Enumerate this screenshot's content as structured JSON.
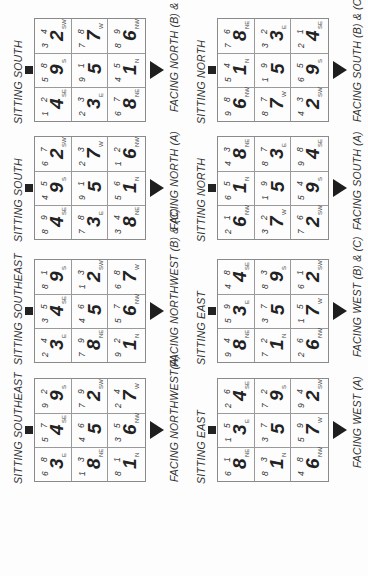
{
  "charts": [
    {
      "sitting": "SITTING SOUTHEAST",
      "facing": "FACING NORTHWEST(A)",
      "cells": [
        {
          "m": "6",
          "w": "8",
          "p": "3",
          "d": "E"
        },
        {
          "m": "5",
          "w": "7",
          "p": "4",
          "d": "SE"
        },
        {
          "m": "9",
          "w": "2",
          "p": "9",
          "d": "S"
        },
        {
          "m": "1",
          "w": "3",
          "p": "8",
          "d": "NE"
        },
        {
          "m": "4",
          "w": "6",
          "p": "5",
          "d": ""
        },
        {
          "m": "7",
          "w": "9",
          "p": "2",
          "d": "SW"
        },
        {
          "m": "8",
          "w": "1",
          "p": "1",
          "d": "N"
        },
        {
          "m": "3",
          "w": "5",
          "p": "6",
          "d": "NW"
        },
        {
          "m": "2",
          "w": "4",
          "p": "7",
          "d": "W"
        }
      ]
    },
    {
      "sitting": "SITTING SOUTHEAST",
      "facing": "FACING NORTHWEST (B) & (C)",
      "cells": [
        {
          "m": "2",
          "w": "4",
          "p": "3",
          "d": "E"
        },
        {
          "m": "3",
          "w": "5",
          "p": "4",
          "d": "SE"
        },
        {
          "m": "8",
          "w": "1",
          "p": "9",
          "d": "S"
        },
        {
          "m": "7",
          "w": "9",
          "p": "8",
          "d": "NE"
        },
        {
          "m": "4",
          "w": "6",
          "p": "5",
          "d": ""
        },
        {
          "m": "1",
          "w": "3",
          "p": "2",
          "d": "SW"
        },
        {
          "m": "9",
          "w": "2",
          "p": "1",
          "d": "N"
        },
        {
          "m": "5",
          "w": "7",
          "p": "6",
          "d": "NW"
        },
        {
          "m": "6",
          "w": "8",
          "p": "7",
          "d": "W"
        }
      ]
    },
    {
      "sitting": "SITTING SOUTH",
      "facing": "FACING NORTH (A)",
      "cells": [
        {
          "m": "8",
          "w": "9",
          "p": "4",
          "d": "SE"
        },
        {
          "m": "4",
          "w": "5",
          "p": "9",
          "d": "S"
        },
        {
          "m": "6",
          "w": "7",
          "p": "2",
          "d": "SW"
        },
        {
          "m": "7",
          "w": "8",
          "p": "3",
          "d": "E"
        },
        {
          "m": "9",
          "w": "1",
          "p": "5",
          "d": ""
        },
        {
          "m": "2",
          "w": "3",
          "p": "7",
          "d": "W"
        },
        {
          "m": "3",
          "w": "4",
          "p": "8",
          "d": "NE"
        },
        {
          "m": "5",
          "w": "6",
          "p": "1",
          "d": "N"
        },
        {
          "m": "1",
          "w": "2",
          "p": "6",
          "d": "NW"
        }
      ]
    },
    {
      "sitting": "SITTING SOUTH",
      "facing": "FACING NORTH (B) & (C)",
      "cells": [
        {
          "m": "1",
          "w": "2",
          "p": "4",
          "d": "SE"
        },
        {
          "m": "5",
          "w": "8",
          "p": "9",
          "d": "S"
        },
        {
          "m": "3",
          "w": "4",
          "p": "2",
          "d": "SW"
        },
        {
          "m": "2",
          "w": "3",
          "p": "3",
          "d": "E"
        },
        {
          "m": "9",
          "w": "1",
          "p": "5",
          "d": ""
        },
        {
          "m": "7",
          "w": "8",
          "p": "7",
          "d": "W"
        },
        {
          "m": "6",
          "w": "7",
          "p": "8",
          "d": "NE"
        },
        {
          "m": "4",
          "w": "5",
          "p": "1",
          "d": "N"
        },
        {
          "m": "8",
          "w": "9",
          "p": "6",
          "d": "NW"
        }
      ]
    },
    {
      "sitting": "SITTING EAST",
      "facing": "FACING WEST (A)",
      "cells": [
        {
          "m": "6",
          "w": "1",
          "p": "8",
          "d": "NE"
        },
        {
          "m": "1",
          "w": "5",
          "p": "3",
          "d": "E"
        },
        {
          "m": "2",
          "w": "6",
          "p": "4",
          "d": "SE"
        },
        {
          "m": "8",
          "w": "3",
          "p": "1",
          "d": "N"
        },
        {
          "m": "3",
          "w": "7",
          "p": "5",
          "d": ""
        },
        {
          "m": "7",
          "w": "2",
          "p": "9",
          "d": "S"
        },
        {
          "m": "4",
          "w": "8",
          "p": "6",
          "d": "NW"
        },
        {
          "m": "5",
          "w": "9",
          "p": "7",
          "d": "W"
        },
        {
          "m": "9",
          "w": "4",
          "p": "2",
          "d": "SW"
        }
      ]
    },
    {
      "sitting": "SITTING EAST",
      "facing": "FACING WEST (B) & (C)",
      "cells": [
        {
          "m": "9",
          "w": "4",
          "p": "8",
          "d": "NE"
        },
        {
          "m": "5",
          "w": "9",
          "p": "3",
          "d": "E"
        },
        {
          "m": "4",
          "w": "8",
          "p": "4",
          "d": "SE"
        },
        {
          "m": "7",
          "w": "2",
          "p": "1",
          "d": "N"
        },
        {
          "m": "3",
          "w": "7",
          "p": "5",
          "d": ""
        },
        {
          "m": "8",
          "w": "3",
          "p": "9",
          "d": "S"
        },
        {
          "m": "2",
          "w": "6",
          "p": "6",
          "d": "NW"
        },
        {
          "m": "1",
          "w": "5",
          "p": "7",
          "d": "W"
        },
        {
          "m": "6",
          "w": "1",
          "p": "2",
          "d": "SW"
        }
      ]
    },
    {
      "sitting": "SITTING NORTH",
      "facing": "FACING SOUTH (A)",
      "cells": [
        {
          "m": "2",
          "w": "1",
          "p": "6",
          "d": "NW"
        },
        {
          "m": "6",
          "w": "5",
          "p": "1",
          "d": "N"
        },
        {
          "m": "4",
          "w": "3",
          "p": "8",
          "d": "NE"
        },
        {
          "m": "3",
          "w": "2",
          "p": "7",
          "d": "W"
        },
        {
          "m": "1",
          "w": "9",
          "p": "5",
          "d": ""
        },
        {
          "m": "8",
          "w": "7",
          "p": "3",
          "d": "E"
        },
        {
          "m": "7",
          "w": "6",
          "p": "2",
          "d": "SW"
        },
        {
          "m": "5",
          "w": "4",
          "p": "9",
          "d": "S"
        },
        {
          "m": "9",
          "w": "8",
          "p": "4",
          "d": "SE"
        }
      ]
    },
    {
      "sitting": "SITTING NORTH",
      "facing": "FACING SOUTH (B) & (C)",
      "cells": [
        {
          "m": "9",
          "w": "8",
          "p": "6",
          "d": "NW"
        },
        {
          "m": "5",
          "w": "4",
          "p": "1",
          "d": "N"
        },
        {
          "m": "7",
          "w": "6",
          "p": "8",
          "d": "NE"
        },
        {
          "m": "8",
          "w": "7",
          "p": "7",
          "d": "W"
        },
        {
          "m": "1",
          "w": "9",
          "p": "5",
          "d": ""
        },
        {
          "m": "3",
          "w": "2",
          "p": "3",
          "d": "E"
        },
        {
          "m": "4",
          "w": "3",
          "p": "2",
          "d": "SW"
        },
        {
          "m": "6",
          "w": "5",
          "p": "9",
          "d": "S"
        },
        {
          "m": "2",
          "w": "1",
          "p": "4",
          "d": "SE"
        }
      ]
    }
  ]
}
